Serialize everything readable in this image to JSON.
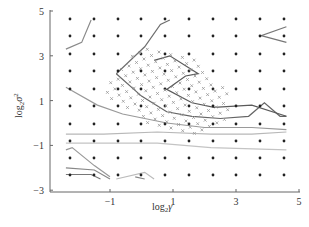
{
  "chart_data": {
    "type": "contour",
    "title": "",
    "xlabel": "log₂γ",
    "ylabel": "log₂σ²",
    "xlabel_parts": {
      "base": "log",
      "sub": "2",
      "var": "γ"
    },
    "ylabel_parts": {
      "base": "log",
      "sub": "2",
      "var": "σ",
      "sup": "2"
    },
    "xlim": [
      -3,
      5
    ],
    "ylim": [
      -3,
      5
    ],
    "xticks": [
      -1,
      1,
      3,
      5
    ],
    "xtick_labels": [
      "−1",
      "1",
      "3",
      "5"
    ],
    "yticks": [
      -3,
      -1,
      1,
      3,
      5
    ],
    "ytick_labels": [
      "−3",
      "−1",
      "1",
      "3",
      "5"
    ],
    "grid": false,
    "legend": null,
    "coarse_grid_points": {
      "marker": "dot",
      "x_values": [
        -2.4,
        -1.6,
        -0.8,
        -0.05,
        0.7,
        1.5,
        2.25,
        3.0,
        3.8,
        4.55
      ],
      "y_values": [
        4.6,
        3.8,
        3.0,
        2.2,
        1.4,
        0.6,
        -0.2,
        -1.0,
        -1.75,
        -2.5
      ]
    },
    "fine_grid_points": {
      "marker": "x",
      "description": "Rotated fine search grid of cross markers",
      "region_x": [
        -1.5,
        2.9
      ],
      "region_y": [
        -0.2,
        3.2
      ]
    },
    "contours": [
      {
        "id": "c1",
        "points": [
          [
            -2.4,
            3.3
          ],
          [
            -1.9,
            3.6
          ],
          [
            -1.6,
            4.6
          ]
        ]
      },
      {
        "id": "c2",
        "points": [
          [
            -0.8,
            2.2
          ],
          [
            -0.2,
            3.0
          ],
          [
            0.1,
            3.4
          ],
          [
            0.6,
            4.4
          ],
          [
            0.9,
            4.6
          ]
        ]
      },
      {
        "id": "c3",
        "points": [
          [
            -0.8,
            2.2
          ],
          [
            0.0,
            1.2
          ],
          [
            0.8,
            0.5
          ],
          [
            1.6,
            0.3
          ],
          [
            2.5,
            0.2
          ],
          [
            3.4,
            0.3
          ],
          [
            3.9,
            0.9
          ],
          [
            4.4,
            0.3
          ],
          [
            4.6,
            0.3
          ]
        ]
      },
      {
        "id": "c4",
        "points": [
          [
            0.4,
            2.8
          ],
          [
            0.9,
            3.0
          ],
          [
            1.8,
            2.2
          ],
          [
            1.4,
            2.1
          ],
          [
            0.8,
            1.5
          ],
          [
            1.6,
            0.9
          ],
          [
            2.3,
            0.7
          ],
          [
            3.5,
            0.8
          ],
          [
            4.6,
            0.3
          ]
        ]
      },
      {
        "id": "c5",
        "points": [
          [
            -2.4,
            1.6
          ],
          [
            -1.4,
            0.8
          ],
          [
            -0.6,
            0.4
          ],
          [
            0.8,
            0.0
          ],
          [
            2.0,
            -0.2
          ],
          [
            3.5,
            -0.2
          ],
          [
            4.6,
            -0.3
          ]
        ]
      },
      {
        "id": "c6",
        "points": [
          [
            -2.4,
            -0.5
          ],
          [
            -1.2,
            -0.5
          ],
          [
            0.5,
            -0.4
          ],
          [
            2.2,
            -0.5
          ],
          [
            3.5,
            -0.5
          ],
          [
            4.6,
            -0.4
          ]
        ]
      },
      {
        "id": "c7",
        "points": [
          [
            -2.4,
            -0.9
          ],
          [
            -1.2,
            -0.9
          ],
          [
            0.5,
            -0.9
          ],
          [
            2.2,
            -1.1
          ],
          [
            4.6,
            -1.2
          ]
        ]
      },
      {
        "id": "c8",
        "points": [
          [
            -2.4,
            -1.2
          ],
          [
            -2.2,
            -1.1
          ],
          [
            -1.5,
            -1.9
          ],
          [
            -1.0,
            -2.4
          ]
        ]
      },
      {
        "id": "c9",
        "points": [
          [
            -2.4,
            -2.0
          ],
          [
            -1.5,
            -2.1
          ],
          [
            -1.0,
            -2.5
          ]
        ]
      },
      {
        "id": "c10",
        "points": [
          [
            -2.4,
            -2.3
          ],
          [
            -1.6,
            -2.3
          ],
          [
            -1.3,
            -2.5
          ]
        ]
      },
      {
        "id": "c11",
        "points": [
          [
            -0.8,
            -2.5
          ],
          [
            0.1,
            -2.2
          ],
          [
            0.4,
            -2.5
          ]
        ]
      },
      {
        "id": "c12",
        "points": [
          [
            -0.2,
            -2.4
          ],
          [
            0.1,
            -2.5
          ]
        ]
      },
      {
        "id": "c13",
        "points": [
          [
            4.6,
            4.3
          ],
          [
            3.8,
            3.9
          ],
          [
            4.6,
            3.6
          ]
        ]
      }
    ]
  }
}
